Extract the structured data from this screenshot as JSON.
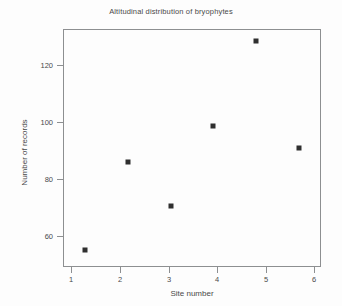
{
  "chart_data": {
    "type": "scatter",
    "title": "Altitudinal distribution of bryophytes",
    "xlabel": "Site number",
    "ylabel": "Number of records",
    "x": [
      1,
      2,
      3,
      4,
      5,
      6
    ],
    "values": [
      53,
      85,
      69,
      98,
      129,
      90
    ],
    "series": [
      {
        "name": "Number of records",
        "points": [
          {
            "x": 1,
            "y": 53
          },
          {
            "x": 2,
            "y": 85
          },
          {
            "x": 3,
            "y": 69
          },
          {
            "x": 4,
            "y": 98
          },
          {
            "x": 5,
            "y": 129
          },
          {
            "x": 6,
            "y": 90
          }
        ]
      }
    ],
    "xlim": [
      0.5,
      6.5
    ],
    "ylim": [
      47,
      133
    ],
    "xticks": [
      "1",
      "2",
      "3",
      "4",
      "5",
      "6"
    ],
    "yticks": [
      "60",
      "80",
      "100",
      "120"
    ],
    "grid": false,
    "legend": "none",
    "marker": "square",
    "marker_color": "#2f2f2f",
    "frame_color": "#8d8f91",
    "background": "#fdfdfd"
  }
}
